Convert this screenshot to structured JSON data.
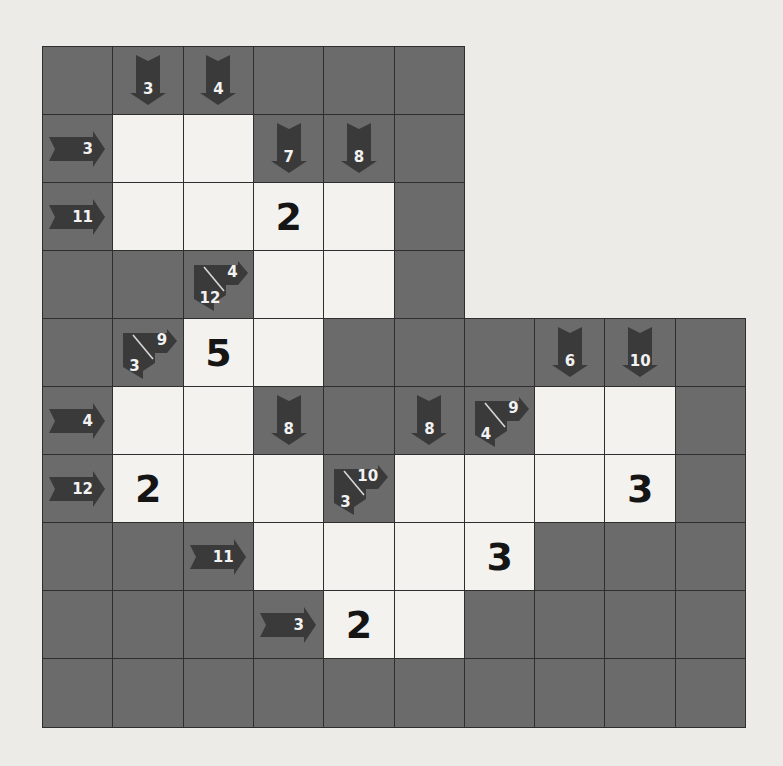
{
  "puzzle": {
    "type": "kakuro",
    "cols": 10,
    "rows": 10,
    "colors": {
      "block": "#6b6b6b",
      "arrow": "#3a3a3a",
      "empty": "#f3f2ef",
      "grid": "#2e2e2e",
      "background": "#ecebe8"
    },
    "cells": [
      [
        {
          "t": "B"
        },
        {
          "t": "C",
          "d": "3"
        },
        {
          "t": "C",
          "d": "4"
        },
        {
          "t": "B"
        },
        {
          "t": "B"
        },
        {
          "t": "B"
        },
        null,
        null,
        null,
        null
      ],
      [
        {
          "t": "C",
          "r": "3"
        },
        {
          "t": "W",
          "v": ""
        },
        {
          "t": "W",
          "v": ""
        },
        {
          "t": "C",
          "d": "7"
        },
        {
          "t": "C",
          "d": "8"
        },
        {
          "t": "B"
        },
        null,
        null,
        null,
        null
      ],
      [
        {
          "t": "C",
          "r": "11"
        },
        {
          "t": "W",
          "v": ""
        },
        {
          "t": "W",
          "v": ""
        },
        {
          "t": "W",
          "v": "2"
        },
        {
          "t": "W",
          "v": ""
        },
        {
          "t": "B"
        },
        null,
        null,
        null,
        null
      ],
      [
        {
          "t": "B"
        },
        {
          "t": "B"
        },
        {
          "t": "C",
          "d": "12",
          "r": "4"
        },
        {
          "t": "W",
          "v": ""
        },
        {
          "t": "W",
          "v": ""
        },
        {
          "t": "B"
        },
        null,
        null,
        null,
        null
      ],
      [
        {
          "t": "B"
        },
        {
          "t": "C",
          "d": "3",
          "r": "9"
        },
        {
          "t": "W",
          "v": "5"
        },
        {
          "t": "W",
          "v": ""
        },
        {
          "t": "B"
        },
        {
          "t": "B"
        },
        {
          "t": "B"
        },
        {
          "t": "C",
          "d": "6"
        },
        {
          "t": "C",
          "d": "10"
        },
        {
          "t": "B"
        }
      ],
      [
        {
          "t": "C",
          "r": "4"
        },
        {
          "t": "W",
          "v": ""
        },
        {
          "t": "W",
          "v": ""
        },
        {
          "t": "C",
          "d": "8"
        },
        {
          "t": "B"
        },
        {
          "t": "C",
          "d": "8"
        },
        {
          "t": "C",
          "d": "4",
          "r": "9"
        },
        {
          "t": "W",
          "v": ""
        },
        {
          "t": "W",
          "v": ""
        },
        {
          "t": "B"
        }
      ],
      [
        {
          "t": "C",
          "r": "12"
        },
        {
          "t": "W",
          "v": "2"
        },
        {
          "t": "W",
          "v": ""
        },
        {
          "t": "W",
          "v": ""
        },
        {
          "t": "C",
          "d": "3",
          "r": "10"
        },
        {
          "t": "W",
          "v": ""
        },
        {
          "t": "W",
          "v": ""
        },
        {
          "t": "W",
          "v": ""
        },
        {
          "t": "W",
          "v": "3"
        },
        {
          "t": "B"
        }
      ],
      [
        {
          "t": "B"
        },
        {
          "t": "B"
        },
        {
          "t": "C",
          "r": "11"
        },
        {
          "t": "W",
          "v": ""
        },
        {
          "t": "W",
          "v": ""
        },
        {
          "t": "W",
          "v": ""
        },
        {
          "t": "W",
          "v": "3"
        },
        {
          "t": "B"
        },
        {
          "t": "B"
        },
        {
          "t": "B"
        }
      ],
      [
        {
          "t": "B"
        },
        {
          "t": "B"
        },
        {
          "t": "B"
        },
        {
          "t": "C",
          "r": "3"
        },
        {
          "t": "W",
          "v": "2"
        },
        {
          "t": "W",
          "v": ""
        },
        {
          "t": "B"
        },
        {
          "t": "B"
        },
        {
          "t": "B"
        },
        {
          "t": "B"
        }
      ],
      [
        {
          "t": "B"
        },
        {
          "t": "B"
        },
        {
          "t": "B"
        },
        {
          "t": "B"
        },
        {
          "t": "B"
        },
        {
          "t": "B"
        },
        {
          "t": "B"
        },
        {
          "t": "B"
        },
        {
          "t": "B"
        },
        {
          "t": "B"
        }
      ]
    ]
  }
}
